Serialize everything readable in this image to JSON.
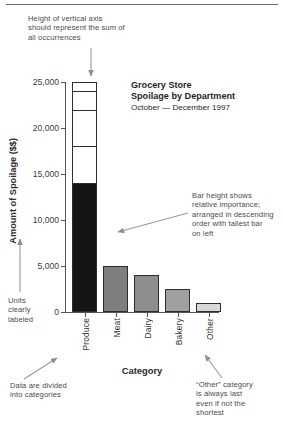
{
  "chart_data": {
    "type": "bar",
    "title": "Grocery Store",
    "title_line2": "Spoilage by Department",
    "subtitle": "October — December 1997",
    "xlabel": "Category",
    "ylabel": "Amount of Spoilage ($$)",
    "categories": [
      "Produce",
      "Meat",
      "Dairy",
      "Bakery",
      "Other"
    ],
    "values": [
      14000,
      5000,
      4000,
      2500,
      1000
    ],
    "ylim": [
      0,
      25000
    ],
    "yticks": [
      "0",
      "5,000",
      "10,000",
      "15,000",
      "20,000",
      "25,000"
    ],
    "ytick_values": [
      0,
      5000,
      10000,
      15000,
      20000,
      25000
    ],
    "grid": false,
    "legend": "none",
    "axis_max_outline": 25000,
    "outline_segments": [
      14000,
      18000,
      22000,
      24000,
      25000
    ],
    "bar_colors": [
      "#151515",
      "#7f7f7f",
      "#8d8d8d",
      "#a0a0a0",
      "#d8d8d8"
    ]
  },
  "annotations": {
    "top": "Height of vertical axis\nshould represent the sum of\nall occurrences",
    "top_l1": "Height of vertical axis",
    "top_l2": "should represent the sum of",
    "top_l3": "all occurrences",
    "right_l1": "Bar height shows",
    "right_l2": "relative importance;",
    "right_l3": "arranged in descending",
    "right_l4": "order with tallest bar",
    "right_l5": "on left",
    "units_l1": "Units",
    "units_l2": "clearly",
    "units_l3": "labeled",
    "bottom_left_l1": "Data are divided",
    "bottom_left_l2": "into categories",
    "bottom_right_l1": "“Other” category",
    "bottom_right_l2": "is always last",
    "bottom_right_l3": "even if not the",
    "bottom_right_l4": "shortest"
  },
  "colors": {
    "ink": "#3b3b3b",
    "axis": "#555555",
    "bar_dark": "#151515",
    "annotation": "#4a4a4a"
  }
}
